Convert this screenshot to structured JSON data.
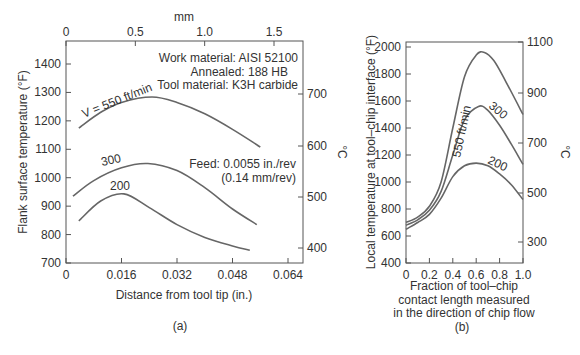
{
  "chart_data": [
    {
      "panel": "(a)",
      "type": "line",
      "title": "",
      "xlabel": "Distance from tool tip (in.)",
      "ylabel": "Flank surface temperature (°F)",
      "y2label": "°C",
      "x2label": "mm",
      "xlim": [
        0,
        0.064
      ],
      "ylim": [
        700,
        1450
      ],
      "xticks": [
        "0",
        "0.016",
        "0.032",
        "0.048",
        "0.064"
      ],
      "yticks": [
        "700",
        "800",
        "900",
        "1000",
        "1100",
        "1200",
        "1300",
        "1400"
      ],
      "x2ticks": [
        "0",
        "0.5",
        "1.0",
        "1.5"
      ],
      "y2ticks": [
        "400",
        "500",
        "600",
        "700"
      ],
      "annotations": [
        "Work material: AISI 52100",
        "Annealed: 188 HB",
        "Tool material: K3H carbide",
        "Feed: 0.0055 in./rev",
        "(0.14 mm/rev)"
      ],
      "series": [
        {
          "name": "V = 550 ft/min",
          "x": [
            0.0037,
            0.01,
            0.016,
            0.0248,
            0.032,
            0.04,
            0.048,
            0.056
          ],
          "y": [
            1175,
            1230,
            1265,
            1284,
            1265,
            1225,
            1170,
            1108
          ]
        },
        {
          "name": "300",
          "x": [
            0.002,
            0.008,
            0.016,
            0.0236,
            0.032,
            0.04,
            0.048,
            0.055
          ],
          "y": [
            935,
            990,
            1035,
            1050,
            1025,
            965,
            890,
            835
          ]
        },
        {
          "name": "200",
          "x": [
            0.0037,
            0.01,
            0.0167,
            0.024,
            0.032,
            0.04,
            0.048,
            0.053
          ],
          "y": [
            848,
            918,
            943,
            895,
            835,
            790,
            760,
            745
          ]
        }
      ]
    },
    {
      "panel": "(b)",
      "type": "line",
      "title": "",
      "xlabel": "Fraction of tool–chip contact length measured in the direction of chip flow",
      "xlabel_lines": [
        "Fraction of tool–chip",
        "contact length measured",
        "in the direction of chip flow"
      ],
      "ylabel": "Local temperature at tool–chip interface (°F)",
      "y2label": "°C",
      "xlim": [
        0,
        1.0
      ],
      "ylim": [
        400,
        2050
      ],
      "xticks": [
        "0",
        "0.2",
        "0.4",
        "0.6",
        "0.8",
        "1.0"
      ],
      "yticks": [
        "400",
        "600",
        "800",
        "1000",
        "1200",
        "1400",
        "1600",
        "1800",
        "2000"
      ],
      "y2ticks": [
        "300",
        "500",
        "700",
        "900",
        "1100"
      ],
      "series": [
        {
          "name": "550 ft/min",
          "x": [
            0,
            0.1,
            0.2,
            0.3,
            0.4,
            0.5,
            0.6,
            0.67,
            0.75,
            0.85,
            1.0
          ],
          "y": [
            700,
            740,
            820,
            1000,
            1400,
            1780,
            1940,
            1960,
            1900,
            1750,
            1500
          ]
        },
        {
          "name": "300",
          "x": [
            0,
            0.1,
            0.2,
            0.3,
            0.4,
            0.5,
            0.62,
            0.7,
            0.8,
            0.9,
            1.0
          ],
          "y": [
            680,
            720,
            790,
            930,
            1200,
            1460,
            1560,
            1530,
            1420,
            1280,
            1130
          ]
        },
        {
          "name": "200",
          "x": [
            0,
            0.1,
            0.2,
            0.3,
            0.4,
            0.5,
            0.6,
            0.7,
            0.8,
            0.9,
            1.0
          ],
          "y": [
            650,
            700,
            760,
            880,
            1040,
            1120,
            1140,
            1120,
            1060,
            980,
            870
          ]
        }
      ]
    }
  ],
  "captions": {
    "a": "(a)",
    "b": "(b)"
  },
  "labels": {
    "a_curve_550": "V = 550 ft/min",
    "a_curve_300": "300",
    "a_curve_200": "200",
    "b_curve_550": "550 ft/min",
    "b_curve_300": "300",
    "b_curve_200": "200"
  }
}
